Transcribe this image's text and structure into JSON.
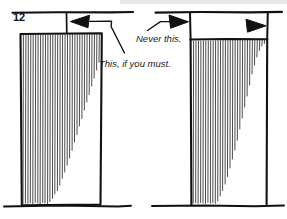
{
  "figure": {
    "page_number": "12",
    "annotations": {
      "never": "Never this.",
      "must": "This, if you must."
    },
    "colors": {
      "ink": "#111111",
      "hatch": "#2b2b2b",
      "paper": "#ffffff"
    },
    "left_panel": {
      "name": "acceptable-detail",
      "arrow_direction": "left",
      "arrow_count": 1,
      "caption_ref": "This, if you must."
    },
    "right_panel": {
      "name": "unacceptable-detail",
      "arrow_direction": "right",
      "arrow_count": 2,
      "caption_ref": "Never this."
    }
  }
}
